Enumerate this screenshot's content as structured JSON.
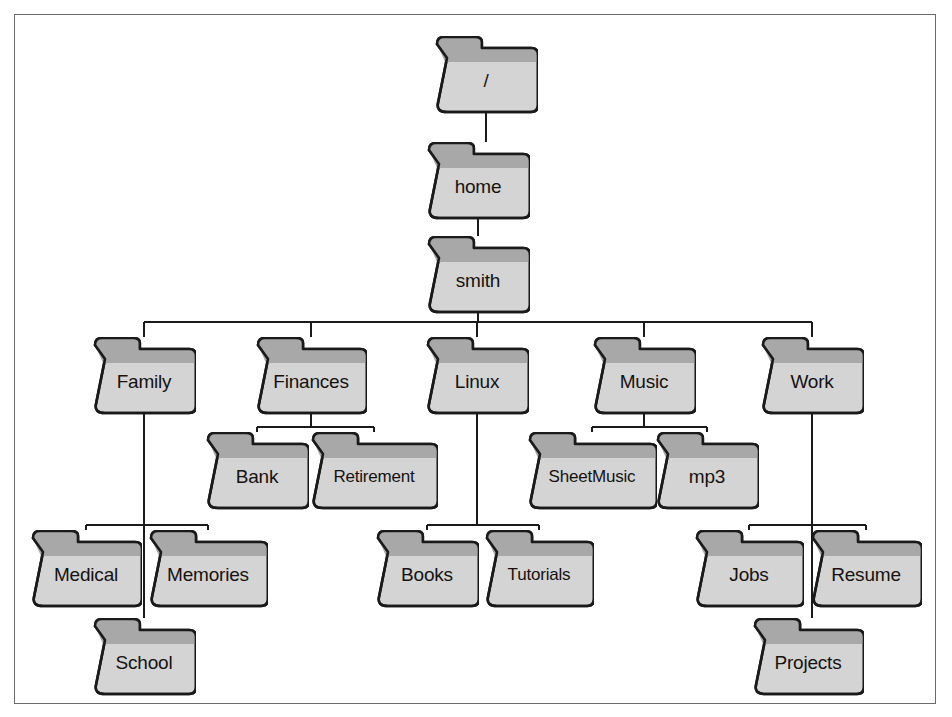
{
  "diagram": {
    "frame": {
      "border_color": "#6b6b6b",
      "background": "#ffffff"
    },
    "style": {
      "folder_body_color": "#d4d4d4",
      "folder_tab_color": "#a8a8a8",
      "folder_outline_color": "#1a1a1a",
      "edge_color": "#1a1a1a",
      "label_color": "#15120f"
    },
    "icon_name": "folder-icon",
    "nodes": [
      {
        "id": "root",
        "label": "/",
        "x": 434,
        "y": 36,
        "w": 104,
        "h": 76,
        "level": 0
      },
      {
        "id": "home",
        "label": "home",
        "x": 426,
        "y": 142,
        "w": 104,
        "h": 76,
        "level": 1
      },
      {
        "id": "smith",
        "label": "smith",
        "x": 426,
        "y": 236,
        "w": 104,
        "h": 76,
        "level": 2
      },
      {
        "id": "family",
        "label": "Family",
        "x": 92,
        "y": 337,
        "w": 104,
        "h": 76,
        "level": 3
      },
      {
        "id": "finances",
        "label": "Finances",
        "x": 255,
        "y": 337,
        "w": 112,
        "h": 76,
        "level": 3
      },
      {
        "id": "linux",
        "label": "Linux",
        "x": 425,
        "y": 337,
        "w": 104,
        "h": 76,
        "level": 3
      },
      {
        "id": "music",
        "label": "Music",
        "x": 592,
        "y": 337,
        "w": 104,
        "h": 76,
        "level": 3
      },
      {
        "id": "work",
        "label": "Work",
        "x": 760,
        "y": 337,
        "w": 104,
        "h": 76,
        "level": 3
      },
      {
        "id": "bank",
        "label": "Bank",
        "x": 205,
        "y": 432,
        "w": 104,
        "h": 76,
        "level": 4
      },
      {
        "id": "retirement",
        "label": "Retirement",
        "x": 310,
        "y": 432,
        "w": 128,
        "h": 76,
        "level": 4
      },
      {
        "id": "sheetmusic",
        "label": "SheetMusic",
        "x": 527,
        "y": 432,
        "w": 130,
        "h": 76,
        "level": 4
      },
      {
        "id": "mp3",
        "label": "mp3",
        "x": 655,
        "y": 432,
        "w": 104,
        "h": 76,
        "level": 4
      },
      {
        "id": "medical",
        "label": "Medical",
        "x": 30,
        "y": 530,
        "w": 112,
        "h": 76,
        "level": 4
      },
      {
        "id": "memories",
        "label": "Memories",
        "x": 148,
        "y": 530,
        "w": 120,
        "h": 76,
        "level": 4
      },
      {
        "id": "books",
        "label": "Books",
        "x": 375,
        "y": 530,
        "w": 104,
        "h": 76,
        "level": 4
      },
      {
        "id": "tutorials",
        "label": "Tutorials",
        "x": 484,
        "y": 530,
        "w": 110,
        "h": 76,
        "level": 4
      },
      {
        "id": "jobs",
        "label": "Jobs",
        "x": 694,
        "y": 530,
        "w": 110,
        "h": 76,
        "level": 4
      },
      {
        "id": "resume",
        "label": "Resume",
        "x": 810,
        "y": 530,
        "w": 112,
        "h": 76,
        "level": 4
      },
      {
        "id": "school",
        "label": "School",
        "x": 92,
        "y": 618,
        "w": 104,
        "h": 76,
        "level": 5
      },
      {
        "id": "projects",
        "label": "Projects",
        "x": 752,
        "y": 618,
        "w": 112,
        "h": 76,
        "level": 5
      }
    ],
    "edges": [
      {
        "from": "root",
        "to": "home"
      },
      {
        "from": "home",
        "to": "smith"
      },
      {
        "from": "smith",
        "to": "family"
      },
      {
        "from": "smith",
        "to": "finances"
      },
      {
        "from": "smith",
        "to": "linux"
      },
      {
        "from": "smith",
        "to": "music"
      },
      {
        "from": "smith",
        "to": "work"
      },
      {
        "from": "finances",
        "to": "bank"
      },
      {
        "from": "finances",
        "to": "retirement"
      },
      {
        "from": "music",
        "to": "sheetmusic"
      },
      {
        "from": "music",
        "to": "mp3"
      },
      {
        "from": "family",
        "to": "medical"
      },
      {
        "from": "family",
        "to": "memories"
      },
      {
        "from": "family",
        "to": "school"
      },
      {
        "from": "linux",
        "to": "books"
      },
      {
        "from": "linux",
        "to": "tutorials"
      },
      {
        "from": "work",
        "to": "jobs"
      },
      {
        "from": "work",
        "to": "resume"
      },
      {
        "from": "work",
        "to": "projects"
      }
    ]
  }
}
